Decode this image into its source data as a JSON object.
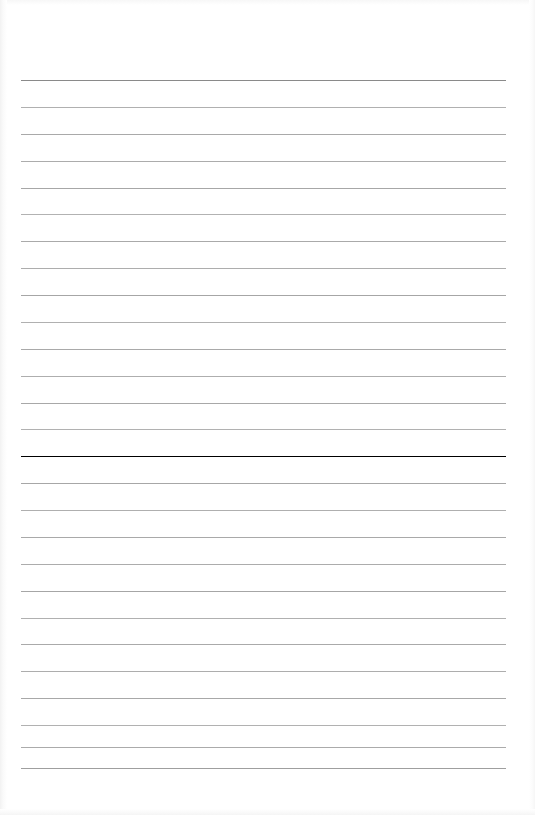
{
  "document": {
    "kind": "lined-paper-scan",
    "title": "Blank Ruled Notebook Page",
    "page_width": 535,
    "page_height": 815,
    "background_color": "#ffffff",
    "text_content": "",
    "has_text": false,
    "has_vertical_margin_rule": false
  },
  "ruling": {
    "line_count": 27,
    "first_line_y": 80,
    "line_spacing": 27,
    "line_start_x": 21,
    "line_end_x": 506,
    "line_length": 485,
    "header_rule_color": "#8a8a8a",
    "header_rule_thickness": 1.6,
    "body_rule_color": "#ababab",
    "body_rule_thickness": 1,
    "margins": {
      "left": 21,
      "right": 29,
      "top": 80,
      "bottom": 47
    }
  },
  "lines": [
    {
      "index": 1,
      "y": 80,
      "color": "#8a8a8a",
      "role": "header-rule"
    },
    {
      "index": 2,
      "y": 107,
      "color": "#b0b0b0",
      "role": "body-rule"
    },
    {
      "index": 3,
      "y": 134,
      "color": "#a9a9a9",
      "role": "body-rule"
    },
    {
      "index": 4,
      "y": 161,
      "color": "#acacac",
      "role": "body-rule"
    },
    {
      "index": 5,
      "y": 188,
      "color": "#a7a7a7",
      "role": "body-rule"
    },
    {
      "index": 6,
      "y": 214,
      "color": "#b2b2b2",
      "role": "body-rule"
    },
    {
      "index": 7,
      "y": 241,
      "color": "#aaaaaa",
      "role": "body-rule"
    },
    {
      "index": 8,
      "y": 268,
      "color": "#adadad",
      "role": "body-rule"
    },
    {
      "index": 9,
      "y": 295,
      "color": "#a6a6a6",
      "role": "body-rule"
    },
    {
      "index": 10,
      "y": 322,
      "color": "#b0b0b0",
      "role": "body-rule"
    },
    {
      "index": 11,
      "y": 349,
      "color": "#a9a9a9",
      "role": "body-rule"
    },
    {
      "index": 12,
      "y": 376,
      "color": "#aeaeae",
      "role": "body-rule"
    },
    {
      "index": 13,
      "y": 403,
      "color": "#a8a8a8",
      "role": "body-rule"
    },
    {
      "index": 14,
      "y": 429,
      "color": "#b1b1b1",
      "role": "body-rule"
    },
    {
      "index": 15,
      "y": 456,
      "color": "#abababa",
      "role": "body-rule"
    },
    {
      "index": 16,
      "y": 483,
      "color": "#a7a7a7",
      "role": "body-rule"
    },
    {
      "index": 17,
      "y": 510,
      "color": "#afafaf",
      "role": "body-rule"
    },
    {
      "index": 18,
      "y": 537,
      "color": "#a9a9a9",
      "role": "body-rule"
    },
    {
      "index": 19,
      "y": 564,
      "color": "#acacac",
      "role": "body-rule"
    },
    {
      "index": 20,
      "y": 591,
      "color": "#a6a6a6",
      "role": "body-rule"
    },
    {
      "index": 21,
      "y": 618,
      "color": "#b0b0b0",
      "role": "body-rule"
    },
    {
      "index": 22,
      "y": 644,
      "color": "#aaaaaa",
      "role": "body-rule"
    },
    {
      "index": 23,
      "y": 671,
      "color": "#adadad",
      "role": "body-rule"
    },
    {
      "index": 24,
      "y": 698,
      "color": "#a8a8a8",
      "role": "body-rule"
    },
    {
      "index": 25,
      "y": 725,
      "color": "#b1b1b1",
      "role": "body-rule"
    },
    {
      "index": 26,
      "y": 747,
      "color": "#ababab",
      "role": "body-rule"
    },
    {
      "index": 27,
      "y": 768,
      "color": "#9f9f9f",
      "role": "body-rule"
    }
  ]
}
